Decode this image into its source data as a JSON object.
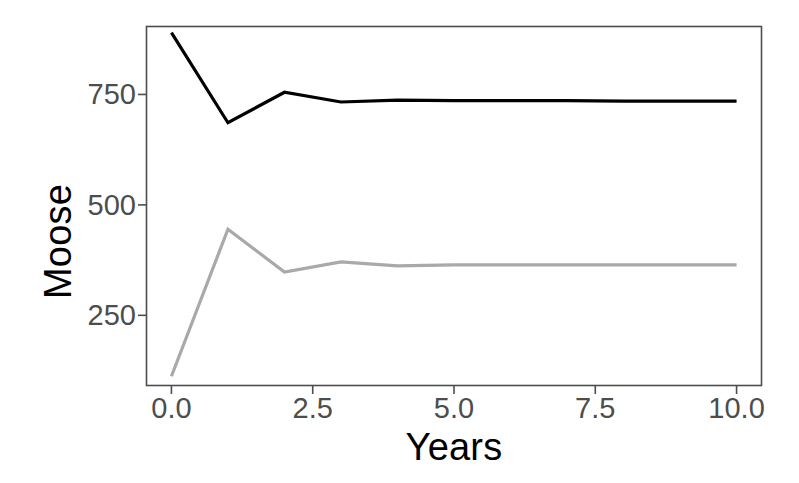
{
  "chart_data": {
    "type": "line",
    "title": "",
    "xlabel": "Years",
    "ylabel": "Moose",
    "xlim": [
      -0.45,
      10.45
    ],
    "ylim": [
      90,
      905
    ],
    "grid": false,
    "legend": "none",
    "xticks": [
      "0.0",
      "2.5",
      "5.0",
      "7.5",
      "10.0"
    ],
    "xtick_values": [
      0.0,
      2.5,
      5.0,
      7.5,
      10.0
    ],
    "yticks": [
      "250",
      "500",
      "750"
    ],
    "ytick_values": [
      250,
      500,
      750
    ],
    "x": [
      0,
      1,
      2,
      3,
      4,
      5,
      6,
      7,
      8,
      9,
      10
    ],
    "series": [
      {
        "name": "upper-trajectory",
        "color": "#000000",
        "linewidth": 3.2,
        "values": [
          890,
          686,
          755,
          733,
          737,
          736,
          736,
          736,
          735,
          735,
          735
        ]
      },
      {
        "name": "lower-trajectory",
        "color": "#a9a9a9",
        "linewidth": 3.2,
        "values": [
          112,
          445,
          348,
          371,
          362,
          364,
          364,
          364,
          364,
          364,
          364
        ]
      }
    ]
  },
  "panel": {
    "border_color": "#4d4d4d",
    "background": "#ffffff",
    "left": 146,
    "top": 26,
    "right": 762,
    "bottom": 386
  },
  "axis_labels": {
    "y_title": "Moose",
    "x_title": "Years"
  }
}
